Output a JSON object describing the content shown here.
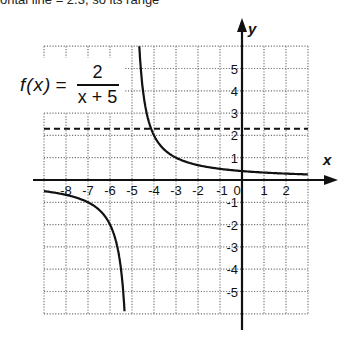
{
  "page": {
    "top_fragment": "ontal line = 2.3, so its range"
  },
  "formula": {
    "lhs": "f(x)",
    "equals": "=",
    "numerator": "2",
    "denominator": "x + 5"
  },
  "chart_data": {
    "type": "line",
    "xlabel": "x",
    "ylabel": "y",
    "xlim": [
      -9,
      3
    ],
    "ylim": [
      -6,
      6
    ],
    "grid": true,
    "x_ticks": [
      "-8",
      "-7",
      "-6",
      "-5",
      "-4",
      "-3",
      "-2",
      "-1",
      "0",
      "1",
      "2"
    ],
    "y_ticks": [
      "5",
      "4",
      "3",
      "2",
      "1",
      "-1",
      "-2",
      "-3",
      "-4",
      "-5"
    ],
    "series": [
      {
        "name": "f(x) = 2/(x+5), right branch",
        "style": "solid",
        "x": [
          -4.67,
          -4.6,
          -4.5,
          -4.33,
          -4,
          -3.5,
          -3,
          -2,
          -1,
          0,
          1,
          2,
          3
        ],
        "y": [
          6,
          5,
          4,
          3,
          2,
          1.33,
          1,
          0.67,
          0.5,
          0.4,
          0.33,
          0.29,
          0.25
        ]
      },
      {
        "name": "f(x) = 2/(x+5), left branch",
        "style": "solid",
        "x": [
          -9,
          -8,
          -7,
          -6,
          -5.5,
          -5.4,
          -5.33
        ],
        "y": [
          -0.5,
          -0.67,
          -1,
          -2,
          -4,
          -5,
          -6
        ]
      },
      {
        "name": "horizontal dashed line",
        "style": "dashed",
        "x": [
          -9,
          3
        ],
        "y": [
          2.3,
          2.3
        ]
      }
    ],
    "legend": null
  }
}
